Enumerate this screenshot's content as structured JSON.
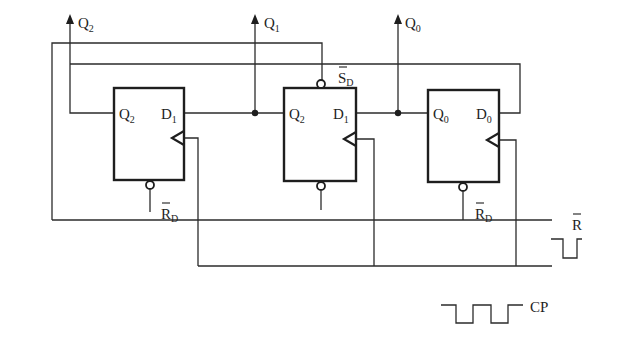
{
  "diagram": {
    "type": "D flip-flop ring counter circuit",
    "outputs": [
      {
        "label": "Q",
        "sub": "2"
      },
      {
        "label": "Q",
        "sub": "1"
      },
      {
        "label": "Q",
        "sub": "0"
      }
    ],
    "flip_flops": [
      {
        "left_pin": {
          "label": "Q",
          "sub": "2"
        },
        "right_pin": {
          "label": "D",
          "sub": "1"
        },
        "bottom_pin": {
          "label": "R",
          "sub": "D"
        }
      },
      {
        "left_pin": {
          "label": "Q",
          "sub": "2"
        },
        "right_pin": {
          "label": "D",
          "sub": "1"
        },
        "top_pin": {
          "label": "S",
          "sub": "D"
        }
      },
      {
        "left_pin": {
          "label": "Q",
          "sub": "0"
        },
        "right_pin": {
          "label": "D",
          "sub": "0"
        },
        "bottom_pin": {
          "label": "R",
          "sub": "D"
        }
      }
    ],
    "signals": {
      "reset": {
        "label": "R",
        "overbar": true
      },
      "clock": {
        "label": "CP"
      }
    },
    "colors": {
      "line": "#2b2b2b",
      "background": "#ffffff"
    }
  }
}
